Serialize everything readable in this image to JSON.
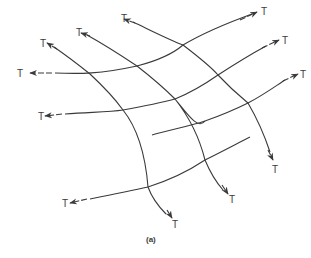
{
  "figure": {
    "caption": "(a)",
    "label": "T",
    "stroke_color": "#3a3a3a",
    "rows": [
      {
        "path": "M55,73 C80,74 100,74 137,66 C160,60 175,52 183,45 C205,32 230,22 252,14",
        "left_arrow": [
          52,
          73,
          30,
          73
        ],
        "right_arrow": [
          240,
          20,
          257,
          12
        ],
        "left_T": [
          17,
          77
        ],
        "right_T": [
          261,
          15
        ]
      },
      {
        "path": "M65,114 C95,112 110,112 123,110 C145,106 160,103 175,99 C195,91 208,82 218,75 C238,62 255,52 266,46",
        "left_arrow": [
          62,
          114,
          45,
          116
        ],
        "right_arrow": [
          262,
          48,
          279,
          40
        ],
        "left_T": [
          38,
          120
        ],
        "right_T": [
          282,
          44
        ]
      },
      {
        "path": "M152,135 C170,130 190,126 205,121 C225,114 238,108 248,103 C265,94 277,85 285,80",
        "left_arrow": null,
        "right_arrow": [
          283,
          81,
          298,
          74
        ],
        "left_T": null,
        "right_T": [
          300,
          78
        ]
      },
      {
        "path": "M90,199 C115,194 130,191 148,187 C170,180 190,170 205,160 C225,150 240,142 250,137",
        "left_arrow": [
          87,
          199,
          70,
          203
        ],
        "right_arrow": null,
        "left_T": [
          62,
          207
        ],
        "right_T": null
      }
    ],
    "columns": [
      {
        "path": "M54,47 C70,58 85,70 90,74 C105,88 118,103 123,110 C135,125 145,150 148,187 C152,198 160,208 166,214",
        "top_arrow": [
          57,
          49,
          47,
          43
        ],
        "bottom_arrow": [
          167,
          210,
          172,
          218
        ],
        "top_T": [
          40,
          47
        ],
        "bottom_T": [
          172,
          228
        ]
      },
      {
        "path": "M87,35 C105,45 125,58 137,66 C155,80 168,92 175,99 C188,115 198,130 205,121 M175,99 C190,118 200,140 205,160 C210,172 216,182 223,190",
        "top_arrow": [
          90,
          36,
          81,
          33
        ],
        "bottom_arrow": [
          222,
          185,
          228,
          194
        ],
        "top_T": [
          76,
          36
        ],
        "bottom_T": [
          229,
          203
        ]
      },
      {
        "path": "M133,22 C150,30 170,40 183,45 C200,58 212,68 218,75 C232,90 242,98 248,103 C258,120 266,140 270,152",
        "top_arrow": [
          135,
          23,
          124,
          19
        ],
        "bottom_arrow": [
          268,
          150,
          273,
          160
        ],
        "top_T": [
          121,
          22
        ],
        "bottom_T": [
          272,
          173
        ]
      }
    ]
  }
}
